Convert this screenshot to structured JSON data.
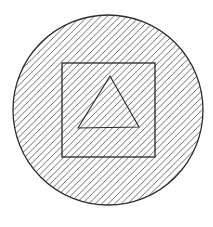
{
  "figure": {
    "canvas": {
      "width": 213,
      "height": 227
    },
    "background_color": "#ffffff",
    "hatch": {
      "direction": "bottom-left-to-top-right",
      "angle_deg": 45,
      "horizontal_period_px": 6.5,
      "color": "#5a5a5a",
      "line_width": 0.9
    },
    "shapes": [
      {
        "name": "outer-circle",
        "type": "circle",
        "cx": 108,
        "cy": 110,
        "r": 95,
        "stroke": "#2e2e2e",
        "stroke_width": 1.3,
        "fill": "hatch"
      },
      {
        "name": "inner-square",
        "type": "rect",
        "x": 62,
        "y": 63,
        "width": 93,
        "height": 94,
        "stroke": "#262626",
        "stroke_width": 1.3,
        "fill": "none"
      },
      {
        "name": "inner-triangle",
        "type": "polygon",
        "points": [
          [
            110,
            76
          ],
          [
            78,
            128
          ],
          [
            139,
            127
          ]
        ],
        "stroke": "#262626",
        "stroke_width": 1.1,
        "fill": "none"
      }
    ]
  }
}
